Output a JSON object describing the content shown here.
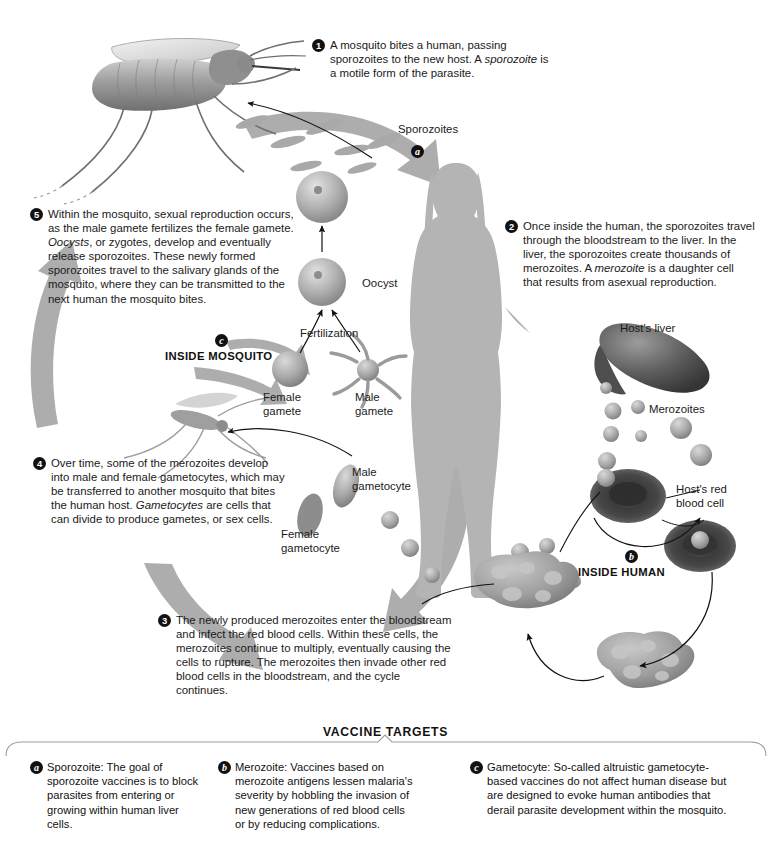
{
  "diagram": {
    "steps": [
      {
        "num": "1",
        "x": 312,
        "y": 38,
        "w": 240,
        "text": "A mosquito bites a human, passing sporozoites to the new host. A ",
        "em": "sporozoite",
        "text2": " is a motile form of the parasite."
      },
      {
        "num": "2",
        "x": 505,
        "y": 219,
        "w": 250,
        "text": "Once inside the human, the sporozoites travel through the bloodstream to the liver. In the liver, the sporozoites create thousands of merozoites. A ",
        "em": "merozoite",
        "text2": " is a daughter cell that results from asexual reproduction."
      },
      {
        "num": "3",
        "x": 158,
        "y": 613,
        "w": 290,
        "text": "The newly produced merozoites enter the bloodstream and infect the red blood cells. Within these cells, the merozoites continue to multiply, eventually causing the cells to rupture. The merozoites then invade other red blood cells in the bloodstream, and the cycle continues.",
        "em": "",
        "text2": ""
      },
      {
        "num": "4",
        "x": 33,
        "y": 456,
        "w": 248,
        "text": "Over time, some of the merozoites develop into male and female gametocytes, which may be transferred to another mosquito that bites the human host. ",
        "em": "Gametocytes",
        "text2": " are cells that can divide to produce gametes, or sex cells."
      },
      {
        "num": "5",
        "x": 30,
        "y": 207,
        "w": 262,
        "text": "Within the mosquito, sexual reproduction occurs, as the male gamete fertilizes the female gamete. ",
        "em": "Oocysts",
        "text2": ", or zygotes, develop and eventually release sporozoites. These newly formed sporozoites travel to the salivary glands of the mosquito, where they can be transmitted to the next human the mosquito bites."
      }
    ],
    "labels": [
      {
        "name": "sporozoites",
        "text": "Sporozoites",
        "x": 398,
        "y": 123,
        "align": "left"
      },
      {
        "name": "oocyst",
        "text": "Oocyst",
        "x": 362,
        "y": 277,
        "align": "left"
      },
      {
        "name": "fertilization",
        "text": "Fertilization",
        "x": 300,
        "y": 327,
        "align": "left"
      },
      {
        "name": "female-gamete",
        "text": "Female\ngamete",
        "x": 263,
        "y": 391,
        "align": "left"
      },
      {
        "name": "male-gamete",
        "text": "Male\ngamete",
        "x": 355,
        "y": 391,
        "align": "left"
      },
      {
        "name": "male-gametocyte",
        "text": "Male\ngametocyte",
        "x": 352,
        "y": 466,
        "align": "left"
      },
      {
        "name": "female-gametocyte",
        "text": "Female\ngametocyte",
        "x": 281,
        "y": 528,
        "align": "left"
      },
      {
        "name": "hosts-liver",
        "text": "Host's liver",
        "x": 620,
        "y": 322,
        "align": "left"
      },
      {
        "name": "merozoites",
        "text": "Merozoites",
        "x": 649,
        "y": 403,
        "align": "left"
      },
      {
        "name": "hosts-red-blood-cell",
        "text": "Host's red\nblood cell",
        "x": 676,
        "y": 483,
        "align": "left"
      }
    ],
    "zone_mosquito": {
      "badge": "c",
      "caption": "INSIDE MOSQUITO",
      "x": 165,
      "y": 332
    },
    "zone_human": {
      "badge": "b",
      "caption": "INSIDE HUMAN",
      "x": 578,
      "y": 548
    },
    "sporozoite_badge": {
      "badge": "a",
      "x": 411,
      "y": 142
    }
  },
  "vaccine": {
    "heading": "VACCINE TARGETS",
    "cards": [
      {
        "badge": "a",
        "x": 30,
        "y": 760,
        "w": 170,
        "text": "Sporozoite: The goal of sporozoite vaccines is to block parasites from entering or growing within human liver cells."
      },
      {
        "badge": "b",
        "x": 218,
        "y": 760,
        "w": 190,
        "text": "Merozoite: Vaccines based on merozoite antigens lessen malaria's severity by hobbling the invasion of new generations of red blood cells or by reducing complications."
      },
      {
        "badge": "c",
        "x": 470,
        "y": 760,
        "w": 260,
        "text": "Gametocyte: So-called altruistic gametocyte-based vaccines do not affect human disease but are designed to evoke human antibodies that derail parasite development within the mosquito."
      }
    ]
  },
  "colors": {
    "arrow_gray": "#adadad",
    "silhouette": "#b4b4b4",
    "cell_gray": "#9a9a9a",
    "dark_cell": "#4a4a4a",
    "text": "#1a1a1a",
    "rule": "#9d9d9d"
  }
}
